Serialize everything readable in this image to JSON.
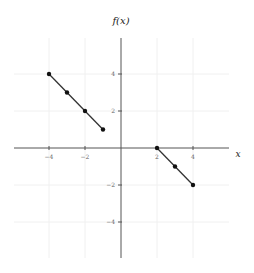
{
  "chart_data": {
    "type": "scatter",
    "title": "f(x)",
    "xlabel": "x",
    "ylabel": "f(x)",
    "xlim": [
      -6,
      6
    ],
    "ylim": [
      -6,
      6
    ],
    "grid": true,
    "x_ticks": [
      -4,
      -2,
      2,
      4
    ],
    "y_ticks": [
      4,
      2,
      -2,
      -4
    ],
    "x_tick_labels": [
      "−4",
      "−2",
      "2",
      "4"
    ],
    "y_tick_labels": [
      "4",
      "2",
      "−2",
      "−4"
    ],
    "series": [
      {
        "name": "segment-left",
        "points": [
          [
            -4,
            4
          ],
          [
            -3,
            3
          ],
          [
            -2,
            2
          ],
          [
            -1,
            1
          ]
        ]
      },
      {
        "name": "segment-right",
        "points": [
          [
            2,
            0
          ],
          [
            3,
            -1
          ],
          [
            4,
            -2
          ]
        ]
      }
    ]
  }
}
